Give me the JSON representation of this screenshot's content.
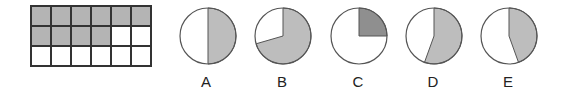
{
  "grid": {
    "rows": 3,
    "cols": 6,
    "shaded_count": 10,
    "shaded_color": "#b4b4b4",
    "border_color": "#333333"
  },
  "pies": [
    {
      "label": "A",
      "fraction": 0.5,
      "start_deg": 0,
      "color": "#bdbdbd"
    },
    {
      "label": "B",
      "fraction": 0.705,
      "start_deg": 0,
      "color": "#bdbdbd"
    },
    {
      "label": "C",
      "fraction": 0.25,
      "start_deg": 0,
      "color": "#8f8f8f"
    },
    {
      "label": "D",
      "fraction": 0.555,
      "start_deg": 0,
      "color": "#bdbdbd"
    },
    {
      "label": "E",
      "fraction": 0.445,
      "start_deg": 0,
      "color": "#bdbdbd"
    }
  ]
}
